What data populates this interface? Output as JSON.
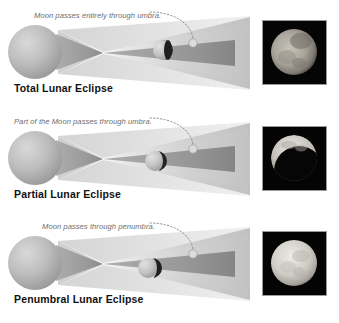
{
  "figure": {
    "background_color": "#ffffff",
    "earth_color": "#b3b3b3",
    "penumbra_color": "#c9c9c9",
    "umbra_color": "#8a8a8a",
    "annotation_color": "#6e6e6e",
    "caption_color": "#111111",
    "photo_background": "#000000"
  },
  "panels": [
    {
      "id": "total",
      "caption": "Total Lunar Eclipse",
      "annotation": "Moon passes entirely through umbra.",
      "moon_state": "fully inside umbra",
      "photo_alt": "Moon during total lunar eclipse, fully darkened reddish disk"
    },
    {
      "id": "partial",
      "caption": "Partial Lunar Eclipse",
      "annotation": "Part of the Moon passes through umbra.",
      "moon_state": "partially inside umbra",
      "photo_alt": "Moon during partial lunar eclipse, bright crescent remaining"
    },
    {
      "id": "penumbral",
      "caption": "Penumbral Lunar Eclipse",
      "annotation": "Moon passes through penumbra.",
      "moon_state": "inside penumbra only",
      "photo_alt": "Moon during penumbral lunar eclipse, nearly full bright disk"
    }
  ]
}
